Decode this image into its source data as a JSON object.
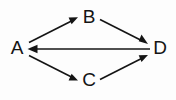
{
  "diagram": {
    "type": "directed-graph",
    "background_color": "#fdfdfd",
    "stroke_color": "#141414",
    "nodes": [
      {
        "id": "A",
        "label": "A",
        "x": 17,
        "y": 48
      },
      {
        "id": "B",
        "label": "B",
        "x": 88,
        "y": 17
      },
      {
        "id": "C",
        "label": "C",
        "x": 88,
        "y": 80
      },
      {
        "id": "D",
        "label": "D",
        "x": 159,
        "y": 48
      }
    ],
    "edges": [
      {
        "id": "a-to-b",
        "from": "A",
        "to": "B",
        "directed": true,
        "arrow_at": "B"
      },
      {
        "id": "b-to-d",
        "from": "B",
        "to": "D",
        "directed": true,
        "arrow_at": "D"
      },
      {
        "id": "a-to-c",
        "from": "A",
        "to": "C",
        "directed": true,
        "arrow_at": "C"
      },
      {
        "id": "c-to-d",
        "from": "C",
        "to": "D",
        "directed": true,
        "arrow_at": "D"
      },
      {
        "id": "d-to-a",
        "from": "D",
        "to": "A",
        "directed": true,
        "arrow_at": "A"
      }
    ]
  }
}
